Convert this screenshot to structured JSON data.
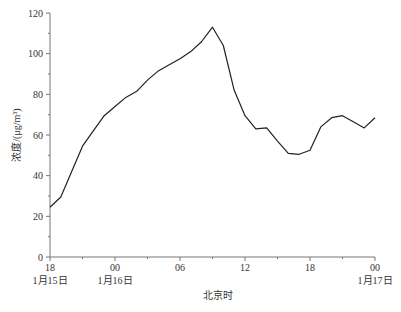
{
  "chart_data": {
    "type": "line",
    "title": "",
    "xlabel": "北京时",
    "ylabel": "浓度/(μg/m³)",
    "ylim": [
      0,
      120
    ],
    "yticks": [
      0,
      20,
      40,
      60,
      80,
      100,
      120
    ],
    "xticks": [
      {
        "hour": 0,
        "label": "18",
        "date": "1月15日"
      },
      {
        "hour": 6,
        "label": "00",
        "date": "1月16日"
      },
      {
        "hour": 12,
        "label": "06",
        "date": ""
      },
      {
        "hour": 18,
        "label": "12",
        "date": ""
      },
      {
        "hour": 24,
        "label": "18",
        "date": ""
      },
      {
        "hour": 30,
        "label": "00",
        "date": "1月17日"
      }
    ],
    "x_hours_from_start": [
      0,
      1,
      2,
      3,
      4,
      5,
      6,
      7,
      8,
      9,
      10,
      11,
      12,
      13,
      14,
      15,
      16,
      17,
      18,
      19,
      20,
      21,
      22,
      23,
      24,
      25,
      26,
      27,
      28,
      29,
      30
    ],
    "series": [
      {
        "name": "浓度",
        "color": "#222222",
        "values": [
          24.5,
          29.5,
          42,
          54.5,
          62,
          69.5,
          74,
          78.5,
          81.5,
          87,
          91.5,
          94.5,
          97.5,
          101,
          106,
          113,
          104,
          82,
          69.5,
          63,
          63.5,
          57,
          51,
          50.5,
          52.5,
          64,
          68.5,
          69.5,
          66.5,
          63.5,
          68.5
        ]
      }
    ],
    "grid": false,
    "legend": null
  },
  "axis": {
    "x_title": "北京时",
    "y_title": "浓度/(μg/m³)"
  }
}
